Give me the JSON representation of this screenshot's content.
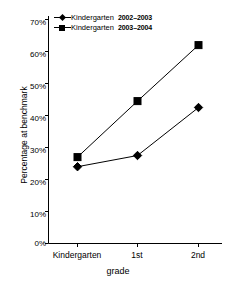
{
  "chart_data": {
    "type": "line",
    "title": "",
    "xlabel": "grade",
    "ylabel": "Percentage at benchmark",
    "categories": [
      "Kindergarten",
      "1st",
      "2nd"
    ],
    "series": [
      {
        "name": "Kindergarten",
        "years": "2002–2003",
        "legend_label": "Kindergarten 2002–2003",
        "marker": "diamond",
        "color": "#000000",
        "values": [
          24,
          27.5,
          42.5
        ]
      },
      {
        "name": "Kindergarten",
        "years": "2003–2004",
        "legend_label": "Kindergarten 2003–2004",
        "marker": "square",
        "color": "#000000",
        "values": [
          27,
          44.5,
          62
        ]
      }
    ],
    "ylim": [
      0,
      70
    ],
    "ytick_values": [
      0,
      10,
      20,
      30,
      40,
      50,
      60,
      70
    ],
    "ytick_labels": [
      "0%",
      "10%",
      "20%",
      "30%",
      "40%",
      "50%",
      "60%",
      "70%"
    ],
    "grid": false,
    "legend_position": "top-left-inside"
  },
  "axes": {
    "y_title": "Percentage at benchmark",
    "x_title": "grade",
    "y_ticks": [
      "70%",
      "60%",
      "50%",
      "40%",
      "30%",
      "20%",
      "10%",
      "0%"
    ],
    "x_ticks": [
      "Kindergarten",
      "1st",
      "2nd"
    ]
  },
  "legend": {
    "entries": [
      {
        "name": "Kindergarten",
        "years": "2002–2003"
      },
      {
        "name": "Kindergarten",
        "years": "2003–2004"
      }
    ]
  }
}
